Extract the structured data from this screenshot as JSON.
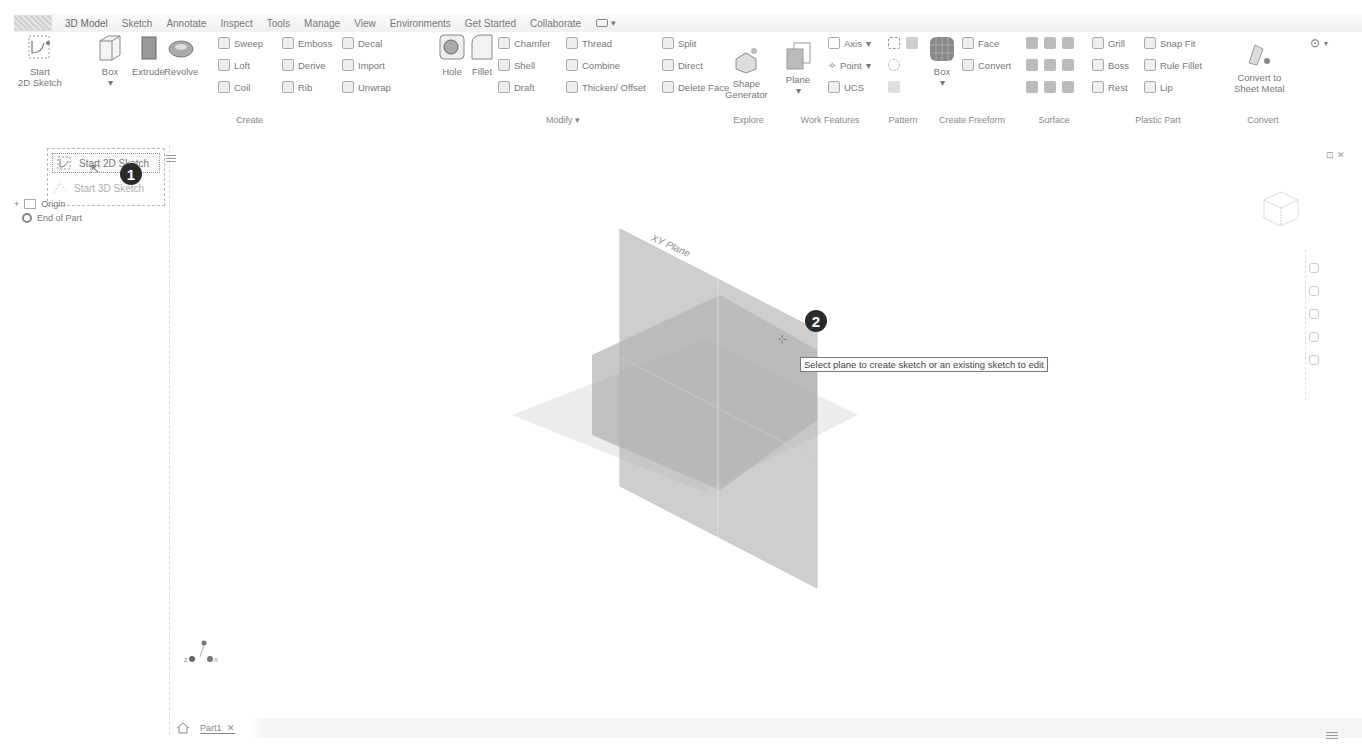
{
  "ribbon_tabs": [
    "3D Model",
    "Sketch",
    "Annotate",
    "Inspect",
    "Tools",
    "Manage",
    "View",
    "Environments",
    "Get Started",
    "Collaborate"
  ],
  "ribbon": {
    "sketch_group": {
      "start_2d_sketch": "Start\n2D Sketch"
    },
    "create": {
      "label": "Create",
      "box": "Box",
      "extrude": "Extrude",
      "revolve": "Revolve",
      "sweep": "Sweep",
      "loft": "Loft",
      "coil": "Coil",
      "emboss": "Emboss",
      "derive": "Derive",
      "rib": "Rib",
      "decal": "Decal",
      "import": "Import",
      "unwrap": "Unwrap"
    },
    "modify": {
      "label": "Modify ▾",
      "hole": "Hole",
      "fillet": "Fillet",
      "chamfer": "Chamfer",
      "shell": "Shell",
      "draft": "Draft",
      "thread": "Thread",
      "combine": "Combine",
      "thicken": "Thicken/ Offset",
      "split": "Split",
      "direct": "Direct",
      "delete_face": "Delete Face"
    },
    "explore": {
      "label": "Explore",
      "shape_generator": "Shape\nGenerator"
    },
    "work_features": {
      "label": "Work Features",
      "plane": "Plane",
      "axis": "Axis",
      "point": "Point",
      "ucs": "UCS"
    },
    "pattern": {
      "label": "Pattern"
    },
    "create_freeform": {
      "label": "Create Freeform",
      "box": "Box",
      "face": "Face",
      "convert": "Convert"
    },
    "surface": {
      "label": "Surface"
    },
    "plastic_part": {
      "label": "Plastic Part",
      "grill": "Grill",
      "boss": "Boss",
      "rest": "Rest",
      "snap_fit": "Snap Fit",
      "rule_fillet": "Rule Fillet",
      "lip": "Lip"
    },
    "convert": {
      "label": "Convert",
      "convert_sheet_metal": "Convert to\nSheet Metal"
    }
  },
  "sidebar": {
    "dropdown": {
      "item1": "Start 2D Sketch",
      "item2": "Start 3D Sketch"
    },
    "tree": {
      "origin": "Origin",
      "end_of_part": "End of Part"
    }
  },
  "callouts": {
    "one": "1",
    "two": "2"
  },
  "viewport": {
    "plane_label": "XY Plane",
    "tooltip": "Select plane to create sketch or an existing sketch to edit"
  },
  "doc_tabs": {
    "part1": "Part1",
    "close": "✕"
  },
  "triad": {
    "z": "Z",
    "x": "X"
  }
}
